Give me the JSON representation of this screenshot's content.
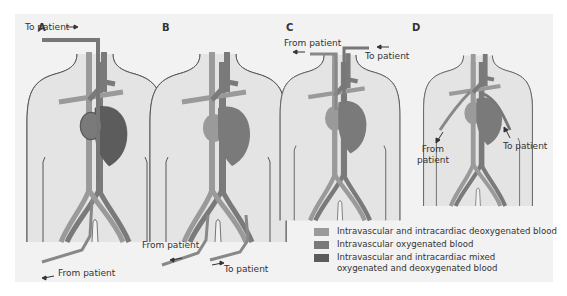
{
  "panels": [
    {
      "id": "A",
      "label": "A",
      "annotations": [
        "To patient",
        "From patient"
      ]
    },
    {
      "id": "B",
      "label": "B",
      "annotations": [
        "From patient",
        "To patient"
      ]
    },
    {
      "id": "C",
      "label": "C",
      "annotations": [
        "From patient",
        "To patient"
      ]
    },
    {
      "id": "D",
      "label": "D",
      "annotations": [
        "From patient",
        "To patient"
      ]
    }
  ],
  "legend": [
    {
      "color": "#9a9a9a",
      "text": "Intravascular and intracardiac deoxygenated blood"
    },
    {
      "color": "#7a7a7a",
      "text": "Intravascular oxygenated blood"
    },
    {
      "color": "#5c5c5c",
      "text": "Intravascular and intracardiac mixed oxygenated and deoxygenated blood"
    }
  ],
  "colors": {
    "background": "#f2f2f2",
    "body_fill": "#e4e4e4",
    "outline": "#555555",
    "deoxygenated": "#9a9a9a",
    "oxygenated": "#7a7a7a",
    "mixed": "#5c5c5c"
  }
}
